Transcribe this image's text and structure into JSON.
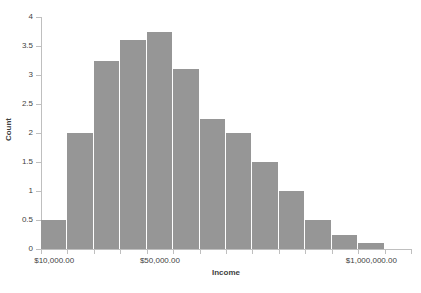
{
  "chart_data": {
    "type": "bar",
    "title": "Household Income 2013-2014",
    "xlabel": "Income",
    "ylabel": "Count",
    "ylim": [
      0,
      4
    ],
    "ytick_values": [
      0,
      0.5,
      1,
      1.5,
      2,
      2.5,
      3,
      3.5,
      4
    ],
    "ytick_labels": [
      "0",
      "0.5",
      "1",
      "1.5",
      "2",
      "2.5",
      "3",
      "3.5",
      "4"
    ],
    "xtick_labels": [
      "$10,000.00",
      "$50,000.00",
      "$1,000,000.00"
    ],
    "xtick_positions": [
      0.5,
      4.5,
      12.5
    ],
    "x_scale": "log",
    "grid": false,
    "legend": null,
    "bar_color": "#969696",
    "bar_separator_color": "#ffffff",
    "axis_color": "#bfbfbf",
    "text_color": "#3f3f3f",
    "n_bins": 14,
    "values": [
      0.5,
      2,
      3.25,
      3.6,
      3.75,
      3.1,
      2.25,
      2,
      1.5,
      1,
      0.5,
      0.25,
      0.1,
      0
    ],
    "categories": [
      "1",
      "2",
      "3",
      "4",
      "5",
      "6",
      "7",
      "8",
      "9",
      "10",
      "11",
      "12",
      "13",
      "14"
    ]
  }
}
